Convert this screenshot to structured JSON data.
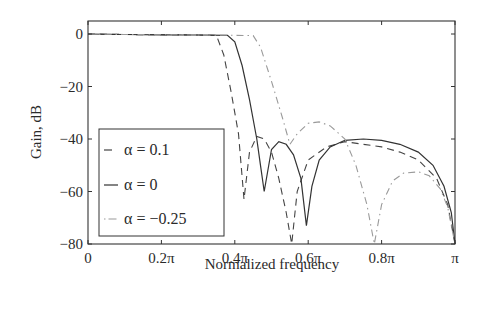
{
  "chart_data": {
    "type": "line",
    "title": "",
    "xlabel": "Normalized frequency",
    "ylabel": "Gain, dB",
    "xlim": [
      0,
      1
    ],
    "ylim": [
      -80,
      5
    ],
    "x_unit": "pi",
    "xticks": [
      0,
      0.2,
      0.4,
      0.6,
      0.8,
      1.0
    ],
    "xtick_labels": [
      "0",
      "0.2π",
      "0.4π",
      "0.6π",
      "0.8π",
      "π"
    ],
    "yticks": [
      0,
      -20,
      -40,
      -60,
      -80
    ],
    "ytick_labels": [
      "0",
      "−20",
      "−40",
      "−60",
      "−80"
    ],
    "grid": false,
    "legend_position": "lower left",
    "series": [
      {
        "name": "α = 0.1",
        "style": "dashed",
        "x": [
          0,
          0.1,
          0.2,
          0.3,
          0.35,
          0.37,
          0.39,
          0.41,
          0.425,
          0.44,
          0.46,
          0.48,
          0.5,
          0.52,
          0.54,
          0.555,
          0.57,
          0.6,
          0.65,
          0.7,
          0.75,
          0.8,
          0.85,
          0.9,
          0.95,
          0.98,
          1.0
        ],
        "y": [
          0,
          -0.2,
          -0.3,
          -0.4,
          -0.5,
          -8,
          -22,
          -38,
          -63,
          -45,
          -39,
          -40,
          -45,
          -55,
          -68,
          -80,
          -60,
          -48,
          -43,
          -41,
          -42,
          -43,
          -45,
          -48,
          -55,
          -65,
          -80
        ]
      },
      {
        "name": "α = 0",
        "style": "solid",
        "x": [
          0,
          0.1,
          0.2,
          0.3,
          0.38,
          0.4,
          0.42,
          0.44,
          0.46,
          0.47,
          0.48,
          0.5,
          0.52,
          0.54,
          0.56,
          0.58,
          0.595,
          0.61,
          0.63,
          0.66,
          0.7,
          0.75,
          0.8,
          0.85,
          0.9,
          0.94,
          0.97,
          0.99,
          1.0
        ],
        "y": [
          0,
          -0.2,
          -0.3,
          -0.4,
          -0.5,
          -3,
          -12,
          -25,
          -40,
          -50,
          -60,
          -44,
          -41,
          -42,
          -46,
          -55,
          -73,
          -58,
          -48,
          -43,
          -40.5,
          -40,
          -40.5,
          -42,
          -45,
          -50,
          -58,
          -68,
          -80
        ]
      },
      {
        "name": "α = −0.25",
        "style": "dash-dot",
        "x": [
          0,
          0.1,
          0.2,
          0.3,
          0.4,
          0.45,
          0.47,
          0.5,
          0.53,
          0.55,
          0.57,
          0.6,
          0.63,
          0.66,
          0.7,
          0.73,
          0.76,
          0.78,
          0.8,
          0.83,
          0.86,
          0.9,
          0.93,
          0.96,
          0.98,
          1.0
        ],
        "y": [
          0,
          -0.2,
          -0.3,
          -0.4,
          -0.5,
          -0.6,
          -5,
          -18,
          -32,
          -42,
          -38,
          -34,
          -33.5,
          -35,
          -40,
          -50,
          -65,
          -80,
          -65,
          -56,
          -53,
          -52.5,
          -54,
          -59,
          -66,
          -80
        ]
      }
    ]
  }
}
